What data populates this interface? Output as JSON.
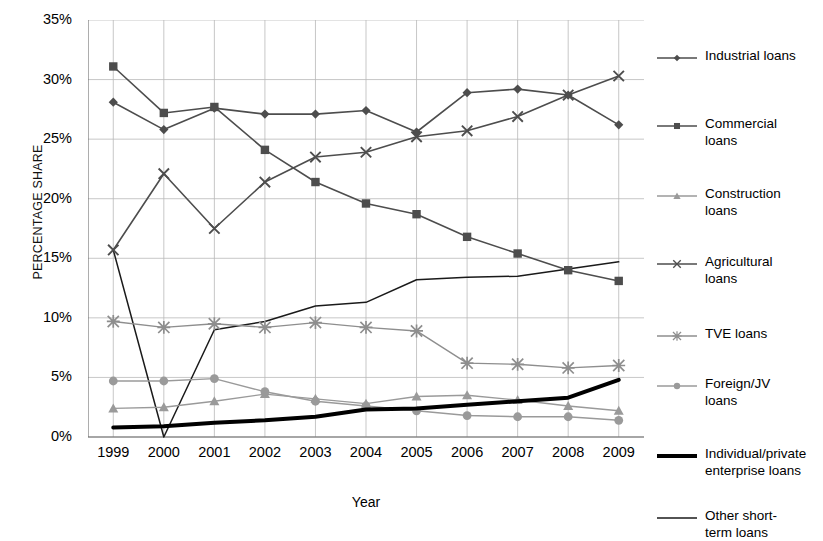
{
  "chart_data": {
    "type": "line",
    "title": "",
    "xlabel": "Year",
    "ylabel": "PERCENTAGE SHARE",
    "categories": [
      "1999",
      "2000",
      "2001",
      "2002",
      "2003",
      "2004",
      "2005",
      "2006",
      "2007",
      "2008",
      "2009"
    ],
    "ylim": [
      0,
      35
    ],
    "ytick_labels": [
      "0%",
      "5%",
      "10%",
      "15%",
      "20%",
      "25%",
      "30%",
      "35%"
    ],
    "ytick_values": [
      0,
      5,
      10,
      15,
      20,
      25,
      30,
      35
    ],
    "grid": true,
    "legend_position": "right",
    "series": [
      {
        "name": "Industrial loans",
        "marker": "diamond",
        "color": "#4d4d4d",
        "line_width": 1.6,
        "values": [
          28.1,
          25.8,
          27.6,
          27.1,
          27.1,
          27.4,
          25.6,
          28.9,
          29.2,
          28.7,
          26.2
        ]
      },
      {
        "name": "Commercial loans",
        "marker": "square",
        "color": "#4d4d4d",
        "line_width": 1.6,
        "values": [
          31.1,
          27.2,
          27.7,
          24.1,
          21.4,
          19.6,
          18.7,
          16.8,
          15.4,
          14.0,
          13.1
        ]
      },
      {
        "name": "Construction loans",
        "marker": "triangle",
        "color": "#9a9a9a",
        "line_width": 1.4,
        "values": [
          2.4,
          2.5,
          3.0,
          3.6,
          3.2,
          2.8,
          3.4,
          3.5,
          3.1,
          2.6,
          2.2
        ]
      },
      {
        "name": "Agricultural loans",
        "marker": "x",
        "color": "#4d4d4d",
        "line_width": 1.6,
        "values": [
          15.7,
          22.1,
          17.5,
          21.4,
          23.5,
          23.9,
          25.2,
          25.7,
          26.9,
          28.7,
          30.3
        ]
      },
      {
        "name": "TVE loans",
        "marker": "asterisk",
        "color": "#8e8e8e",
        "line_width": 1.4,
        "values": [
          9.7,
          9.2,
          9.5,
          9.2,
          9.6,
          9.2,
          8.9,
          6.2,
          6.1,
          5.8,
          6.0
        ]
      },
      {
        "name": "Foreign/JV loans",
        "marker": "circle",
        "color": "#9a9a9a",
        "line_width": 1.4,
        "values": [
          4.7,
          4.7,
          4.9,
          3.8,
          3.0,
          2.6,
          2.2,
          1.8,
          1.7,
          1.7,
          1.4
        ]
      },
      {
        "name": "Individual/private enterprise loans",
        "marker": "none",
        "color": "#000000",
        "line_width": 4.0,
        "values": [
          0.8,
          0.9,
          1.2,
          1.4,
          1.7,
          2.3,
          2.4,
          2.7,
          3.0,
          3.3,
          4.8
        ]
      },
      {
        "name": "Other short-term loans",
        "marker": "none",
        "color": "#1a1a1a",
        "line_width": 1.5,
        "values": [
          15.7,
          0.0,
          9.0,
          9.7,
          11.0,
          11.3,
          13.2,
          13.4,
          13.5,
          14.1,
          14.7
        ]
      }
    ]
  },
  "legend": {
    "items": [
      {
        "label": "Industrial loans"
      },
      {
        "label": "Commercial\nloans"
      },
      {
        "label": "Construction\nloans"
      },
      {
        "label": "Agricultural\nloans"
      },
      {
        "label": "TVE loans"
      },
      {
        "label": "Foreign/JV\nloans"
      },
      {
        "label": "Individual/private\nenterprise loans"
      },
      {
        "label": "Other short-\nterm loans"
      }
    ]
  }
}
